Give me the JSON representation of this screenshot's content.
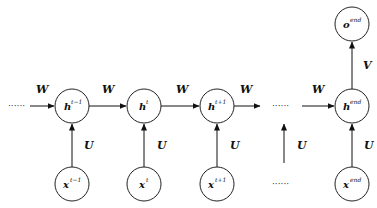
{
  "diagram": {
    "type": "unrolled-rnn",
    "hidden_nodes": [
      {
        "id": "h_tm1",
        "base": "h",
        "sup": "t−1",
        "cx": 72,
        "cy": 106
      },
      {
        "id": "h_t",
        "base": "h",
        "sup": "t",
        "cx": 144,
        "cy": 106
      },
      {
        "id": "h_tp1",
        "base": "h",
        "sup": "t+1",
        "cx": 217,
        "cy": 106
      },
      {
        "id": "h_end",
        "base": "h",
        "sup": "end",
        "cx": 352,
        "cy": 106
      }
    ],
    "input_nodes": [
      {
        "id": "x_tm1",
        "base": "x",
        "sup": "t−1",
        "cx": 72,
        "cy": 184
      },
      {
        "id": "x_t",
        "base": "x",
        "sup": "t",
        "cx": 144,
        "cy": 184
      },
      {
        "id": "x_tp1",
        "base": "x",
        "sup": "t+1",
        "cx": 217,
        "cy": 184
      },
      {
        "id": "x_end",
        "base": "x",
        "sup": "end",
        "cx": 352,
        "cy": 184
      }
    ],
    "output_node": {
      "id": "o_end",
      "base": "o",
      "sup": "end",
      "cx": 352,
      "cy": 24
    },
    "edge_labels": {
      "recurrent": "W",
      "input": "U",
      "output": "V"
    },
    "ellipsis": "······"
  }
}
